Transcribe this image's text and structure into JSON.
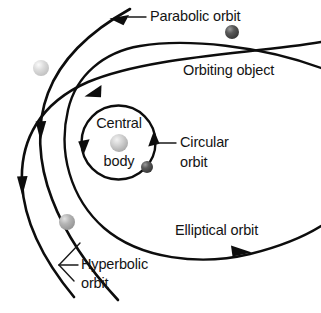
{
  "diagram": {
    "background_color": "#ffffff",
    "stroke_color": "#0d0d0d",
    "labels": {
      "parabolic_orbit": "Parabolic orbit",
      "orbiting_object": "Orbiting object",
      "central_body_line1": "Central",
      "central_body_line2": "body",
      "circular_orbit_line1": "Circular",
      "circular_orbit_line2": "orbit",
      "elliptical_orbit": "Elliptical orbit",
      "hyperbolic_orbit_line1": "Hyperbolic",
      "hyperbolic_orbit_line2": "orbit"
    },
    "orbits": [
      {
        "name": "circular",
        "label": "Circular orbit",
        "shape": "closed-circle",
        "arrow_count": 2
      },
      {
        "name": "elliptical",
        "label": "Elliptical orbit",
        "shape": "open-ellipse",
        "arrow_count": 3
      },
      {
        "name": "parabolic",
        "label": "Parabolic orbit",
        "shape": "parabola",
        "arrow_count": 2
      },
      {
        "name": "hyperbolic",
        "label": "Hyperbolic orbit",
        "shape": "hyperbola",
        "arrow_count": 2
      }
    ],
    "bodies": [
      {
        "name": "central-body",
        "color": "#b9b9b9",
        "highlight": "#e8e8e8",
        "radius": 9,
        "cx": 119,
        "cy": 143
      },
      {
        "name": "object-on-circular-orbit",
        "color": "#4a4a4a",
        "highlight": "#8d8d8d",
        "radius": 6,
        "cx": 147,
        "cy": 167
      },
      {
        "name": "object-on-hyperbolic-orbit-top",
        "color": "#4a4a4a",
        "highlight": "#8e8e8e",
        "radius": 7,
        "cx": 232,
        "cy": 32
      },
      {
        "name": "object-on-hyperbolic-orbit-left",
        "color": "#cfcfcf",
        "highlight": "#f0f0f0",
        "radius": 8,
        "cx": 41,
        "cy": 68
      },
      {
        "name": "object-on-parabolic-orbit",
        "color": "#a8a8a8",
        "highlight": "#dcdcdc",
        "radius": 8,
        "cx": 67,
        "cy": 222
      }
    ]
  }
}
